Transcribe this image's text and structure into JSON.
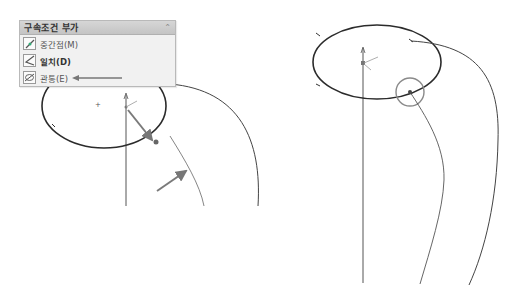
{
  "relations_panel": {
    "title": "구속조건 부가",
    "collapse_icon": "double-chevron-up-icon",
    "items": [
      {
        "label": "중간점(M)",
        "icon": "midpoint-icon",
        "emphasis": false
      },
      {
        "label": "일치(D)",
        "icon": "coincident-icon",
        "emphasis": true
      },
      {
        "label": "관통(E)",
        "icon": "pierce-icon",
        "emphasis": false
      }
    ]
  },
  "colors": {
    "sketch_line": "#2b2b2b",
    "curve": "#555555",
    "callout_arrow": "#7a7a7a",
    "highlight_circle": "#8a8a8a",
    "panel_bg": "#f1f1f1"
  }
}
